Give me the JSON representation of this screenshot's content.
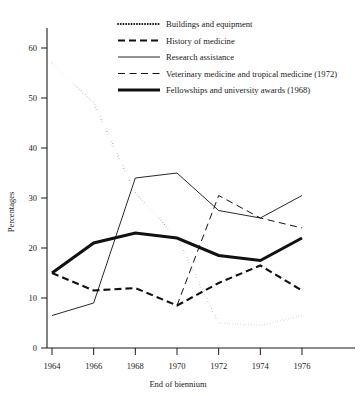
{
  "chart_data": {
    "type": "line",
    "title": "",
    "xlabel": "End of biennium",
    "ylabel": "Percentages",
    "categories": [
      "1964",
      "1966",
      "1968",
      "1970",
      "1972",
      "1974",
      "1976"
    ],
    "x": [
      1964,
      1966,
      1968,
      1970,
      1972,
      1974,
      1976
    ],
    "xlim": [
      1964,
      1976
    ],
    "ylim": [
      0,
      65
    ],
    "yticks": [
      0,
      10,
      20,
      30,
      40,
      50,
      60
    ],
    "ytick_labels": [
      "0",
      "10",
      "20",
      "30",
      "40",
      "50",
      "60"
    ],
    "xticks": [
      1964,
      1966,
      1968,
      1970,
      1972,
      1974,
      1976
    ],
    "xtick_labels": [
      "1964",
      "1966",
      "1968",
      "1970",
      "1972",
      "1974",
      "1976"
    ],
    "grid": false,
    "legend_position": "top-right",
    "series": [
      {
        "name": "Buildings and equipment",
        "style": "dotted",
        "x": [
          1964,
          1966,
          1968,
          1970,
          1972,
          1974,
          1976
        ],
        "values": [
          57,
          49,
          31,
          22,
          5,
          4.5,
          6.5
        ]
      },
      {
        "name": "History of medicine",
        "style": "dashed-bold",
        "x": [
          1964,
          1966,
          1968,
          1970,
          1972,
          1974,
          1976
        ],
        "values": [
          15,
          11.5,
          12,
          8.5,
          13,
          16.5,
          11.5
        ]
      },
      {
        "name": "Research assistance",
        "style": "solid-thin",
        "x": [
          1964,
          1966,
          1968,
          1970,
          1972,
          1974,
          1976
        ],
        "values": [
          6.5,
          9,
          34,
          35,
          27.5,
          26,
          30.5
        ]
      },
      {
        "name": "Veterinary medicine and tropical medicine (1972)",
        "style": "long-dash",
        "x": [
          1970,
          1972,
          1974,
          1976
        ],
        "values": [
          8.5,
          30.5,
          26,
          24
        ]
      },
      {
        "name": "Fellowships and university awards (1968)",
        "style": "solid-thick",
        "x": [
          1964,
          1966,
          1968,
          1970,
          1972,
          1974,
          1976
        ],
        "values": [
          15,
          21,
          23,
          22,
          18.5,
          17.5,
          22
        ]
      }
    ]
  },
  "legend": {
    "items": [
      {
        "label": "Buildings and equipment"
      },
      {
        "label": "History of medicine"
      },
      {
        "label": "Research assistance"
      },
      {
        "label": "Veterinary medicine and tropical medicine (1972)"
      },
      {
        "label": "Fellowships and university awards (1968)"
      }
    ]
  },
  "axes": {
    "y_title": "Percentages",
    "x_title": "End of biennium"
  },
  "colors": {
    "ink": "#111111",
    "background": "#ffffff"
  }
}
